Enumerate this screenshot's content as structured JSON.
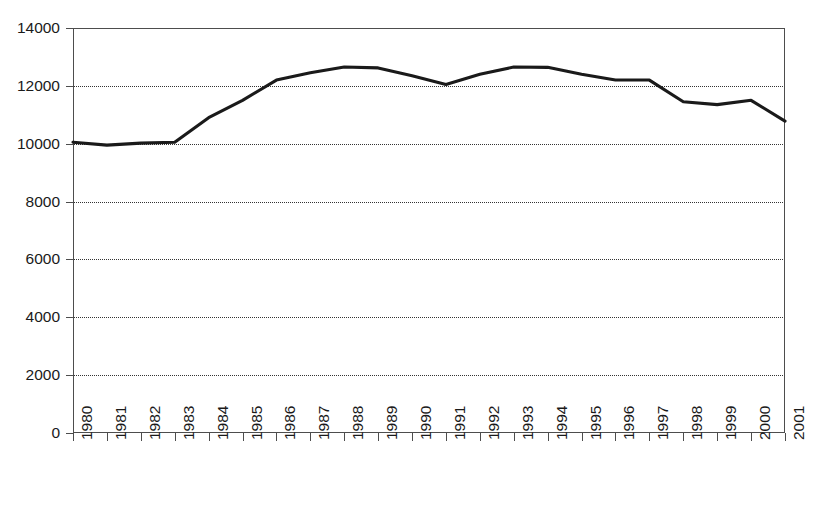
{
  "chart_data": {
    "type": "line",
    "title": "",
    "subtitle": "",
    "xlabel": "",
    "ylabel": "",
    "categories": [
      "1980",
      "1981",
      "1982",
      "1983",
      "1984",
      "1985",
      "1986",
      "1987",
      "1988",
      "1989",
      "1990",
      "1991",
      "1992",
      "1993",
      "1994",
      "1995",
      "1996",
      "1997",
      "1998",
      "1999",
      "2000",
      "2001"
    ],
    "x": [
      1980,
      1981,
      1982,
      1983,
      1984,
      1985,
      1986,
      1987,
      1988,
      1989,
      1990,
      1991,
      1992,
      1993,
      1994,
      1995,
      1996,
      1997,
      1998,
      1999,
      2000,
      2001
    ],
    "values": [
      10050,
      9950,
      10020,
      10050,
      10900,
      11500,
      12200,
      12450,
      12650,
      12620,
      12350,
      12050,
      12400,
      12650,
      12640,
      12400,
      12200,
      12200,
      11450,
      11350,
      11500,
      10780
    ],
    "series": [
      {
        "name": "series-1",
        "color": "#1a1a1a",
        "values": [
          10050,
          9950,
          10020,
          10050,
          10900,
          11500,
          12200,
          12450,
          12650,
          12620,
          12350,
          12050,
          12400,
          12650,
          12640,
          12400,
          12200,
          12200,
          11450,
          11350,
          11500,
          10780
        ]
      }
    ],
    "ylim": [
      0,
      14000
    ],
    "yticks": [
      0,
      2000,
      4000,
      6000,
      8000,
      10000,
      12000,
      14000
    ],
    "ytick_labels": [
      "0",
      "2000",
      "4000",
      "6000",
      "8000",
      "10000",
      "12000",
      "14000"
    ],
    "grid": true,
    "grid_style": "dotted",
    "grid_axis": "y",
    "legend": false,
    "legend_position": "none",
    "xtick_rotation": 90,
    "plot_border": true,
    "colors": {
      "line": "#1a1a1a",
      "grid": "#333333",
      "axis": "#4d4d4d",
      "text": "#1a1a1a",
      "background": "#ffffff"
    }
  }
}
